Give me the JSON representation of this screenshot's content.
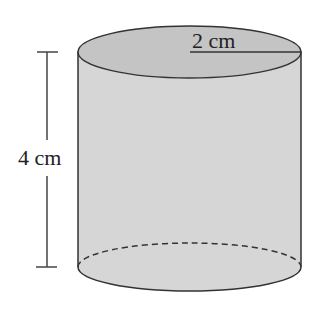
{
  "diagram": {
    "type": "cylinder",
    "radius_label": "2 cm",
    "height_label": "4 cm",
    "colors": {
      "body_fill": "#d6d6d6",
      "top_fill": "#c4c4c4",
      "stroke": "#333333"
    }
  }
}
